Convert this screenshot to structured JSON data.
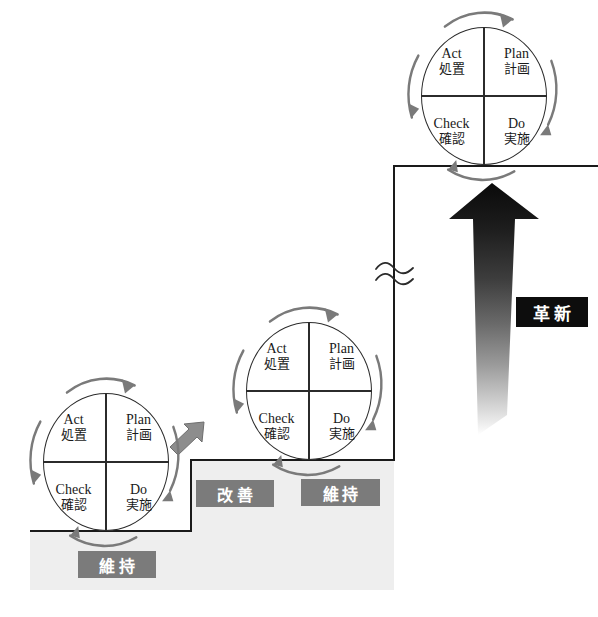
{
  "diagram": {
    "colors": {
      "plateau_fill": "#eeeeee",
      "line": "#1a1a1a",
      "tag_gray": "#7b7b7b",
      "tag_black": "#0d0d0d",
      "wheel_stroke": "#2b2b2b",
      "arc_arrow": "#6f6f6f",
      "kaizen_arrow": "#8a8a8a",
      "big_arrow_dark": "#111111",
      "big_arrow_light": "#ffffff"
    },
    "wheels": [
      {
        "id": "wheel-bottom",
        "quadrants": [
          {
            "key": "act",
            "en": "Act",
            "jp": "処置"
          },
          {
            "key": "plan",
            "en": "Plan",
            "jp": "計画"
          },
          {
            "key": "check",
            "en": "Check",
            "jp": "確認"
          },
          {
            "key": "do",
            "en": "Do",
            "jp": "実施"
          }
        ]
      },
      {
        "id": "wheel-middle",
        "quadrants": [
          {
            "key": "act",
            "en": "Act",
            "jp": "処置"
          },
          {
            "key": "plan",
            "en": "Plan",
            "jp": "計画"
          },
          {
            "key": "check",
            "en": "Check",
            "jp": "確認"
          },
          {
            "key": "do",
            "en": "Do",
            "jp": "実施"
          }
        ]
      },
      {
        "id": "wheel-top",
        "quadrants": [
          {
            "key": "act",
            "en": "Act",
            "jp": "処置"
          },
          {
            "key": "plan",
            "en": "Plan",
            "jp": "計画"
          },
          {
            "key": "check",
            "en": "Check",
            "jp": "確認"
          },
          {
            "key": "do",
            "en": "Do",
            "jp": "実施"
          }
        ]
      }
    ],
    "tags": [
      {
        "id": "tag-maintain-bottom",
        "label": "維持",
        "style": "gray"
      },
      {
        "id": "tag-improve",
        "label": "改善",
        "style": "gray"
      },
      {
        "id": "tag-maintain-middle",
        "label": "維持",
        "style": "gray"
      },
      {
        "id": "tag-innovation",
        "label": "革新",
        "style": "black"
      }
    ]
  }
}
